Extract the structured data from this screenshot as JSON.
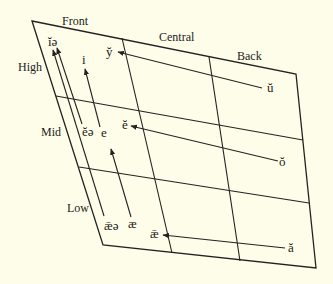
{
  "diagram": {
    "type": "vowel-chart",
    "background": "#fefde9",
    "line_color": "#222222",
    "axis_labels": {
      "front": "Front",
      "central": "Central",
      "back": "Back",
      "high": "High",
      "mid": "Mid",
      "low": "Low"
    },
    "vowels": [
      {
        "id": "ie",
        "base": "iə",
        "mark": "˘",
        "overmark": "̄"
      },
      {
        "id": "y",
        "base": "y",
        "mark": "˘"
      },
      {
        "id": "i",
        "base": "i",
        "mark": ""
      },
      {
        "id": "u",
        "base": "u",
        "mark": "˘"
      },
      {
        "id": "ee",
        "base": "ēə",
        "mark": "˘"
      },
      {
        "id": "e",
        "base": "e",
        "mark": ""
      },
      {
        "id": "e2",
        "base": "e",
        "mark": "˘"
      },
      {
        "id": "o",
        "base": "o",
        "mark": "˘"
      },
      {
        "id": "aee",
        "base": "æə",
        "mark": "˘"
      },
      {
        "id": "ae",
        "base": "æ",
        "mark": ""
      },
      {
        "id": "ae2",
        "base": "æ",
        "mark": "˘"
      },
      {
        "id": "a",
        "base": "a",
        "mark": "˘"
      }
    ],
    "labels": {
      "ie": "ĭə",
      "y": "y̆",
      "i": "i",
      "u": "ŭ",
      "ee": "ĕə",
      "e": "e",
      "e2": "ĕ",
      "o": "ŏ",
      "aee": "ǣə",
      "ae": "æ",
      "ae2": "ǣ",
      "a": "ă"
    },
    "arrows": [
      {
        "from": "ŭ",
        "to": "y̆"
      },
      {
        "from": "ŏ",
        "to": "ĕ"
      },
      {
        "from": "ă",
        "to": "ǣ"
      },
      {
        "from": "ǣə",
        "to": "ĭə"
      },
      {
        "from": "ĕə",
        "to": "ĭə"
      },
      {
        "from": "e",
        "to": "i"
      },
      {
        "from": "æ",
        "to": "e"
      }
    ]
  }
}
